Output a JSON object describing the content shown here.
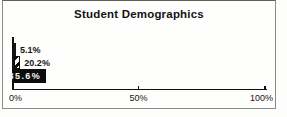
{
  "chart_data": {
    "type": "bar",
    "orientation": "horizontal",
    "title": "Student Demographics",
    "series": [
      {
        "label": "5.1%",
        "value": 5.1,
        "style": "solid-light-gray",
        "label_position": "outside-right"
      },
      {
        "label": "20.2%",
        "value": 20.2,
        "style": "diagonal-hatch",
        "label_position": "outside-right"
      },
      {
        "label": "85.6%",
        "value": 85.6,
        "style": "solid-black",
        "label_position": "inside-right"
      }
    ],
    "xlabel": "",
    "ylabel": "",
    "xlim": [
      0,
      100
    ],
    "x_ticks": [
      {
        "value": 0,
        "label": "0%"
      },
      {
        "value": 50,
        "label": "50%"
      },
      {
        "value": 100,
        "label": "100%"
      }
    ],
    "grid": false,
    "legend_position": "none",
    "colors": {
      "bar_gray_fill": "#b4b4b2",
      "bar_black_fill": "#0c0c0c",
      "hatch_foreground": "#0b0b0b",
      "hatch_background": "#fbfbfb",
      "axis": "#111111",
      "frame_border": "#8a8a88",
      "inside_label_text": "#f4f4f4",
      "text": "#141414"
    }
  }
}
